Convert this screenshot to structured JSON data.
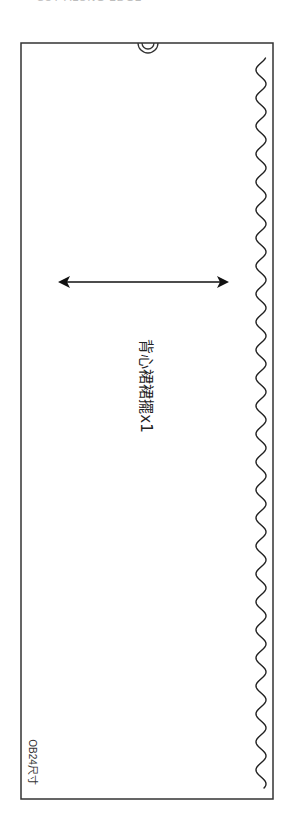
{
  "page": {
    "top_caption": "CUT ALONG EDGE"
  },
  "pattern_piece": {
    "label": "背心裙裙擺x1",
    "size_label": "OB24尺寸",
    "outline": {
      "x": 21,
      "y": 43,
      "width": 252,
      "height": 756,
      "stroke": "#333333"
    },
    "notch": {
      "type": "double-semicircle",
      "cx": 148,
      "cy": 43,
      "r_outer": 10,
      "r_inner": 6
    },
    "grainline_arrow": {
      "x1": 59,
      "x2": 228,
      "y": 282,
      "direction": "double-headed",
      "color": "#111111"
    },
    "scalloped_edge": {
      "x_center": 261,
      "amplitude": 5,
      "period": 28,
      "y_start": 58,
      "y_end": 788,
      "color": "#222222"
    }
  }
}
